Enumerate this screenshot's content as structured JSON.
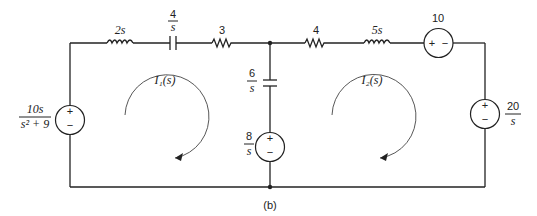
{
  "diagram": {
    "type": "circuit",
    "caption": "(b)",
    "components": {
      "inductor_1": {
        "label": "2s"
      },
      "capacitor_1": {
        "num": "4",
        "den": "s"
      },
      "resistor_1": {
        "label": "3"
      },
      "resistor_2": {
        "label": "4"
      },
      "inductor_2": {
        "label": "5s"
      },
      "source_top": {
        "label": "10",
        "plus": "+",
        "minus": "−"
      },
      "source_left": {
        "num": "10s",
        "den": "s² + 9",
        "plus": "+",
        "minus": "−"
      },
      "capacitor_mid": {
        "num": "6",
        "den": "s"
      },
      "source_mid": {
        "num": "8",
        "den": "s",
        "plus": "+",
        "minus": "−"
      },
      "source_right": {
        "num": "20",
        "den": "s",
        "plus": "+",
        "minus": "−"
      }
    },
    "loops": [
      {
        "label": "I₁(s)",
        "direction": "clockwise"
      },
      {
        "label": "I₂(s)",
        "direction": "clockwise"
      }
    ]
  }
}
